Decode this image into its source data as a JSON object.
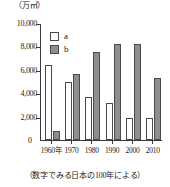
{
  "chart_data": {
    "type": "bar",
    "title": "",
    "subtitle": "",
    "unit_label": "（万㎡）",
    "xlabel": "",
    "ylabel": "",
    "categories": [
      "1960年",
      "1970",
      "1980",
      "1990",
      "2000",
      "2010"
    ],
    "series": [
      {
        "name": "a",
        "values": [
          6400,
          4950,
          3700,
          3150,
          1900,
          1900
        ],
        "color": "#ffffff"
      },
      {
        "name": "b",
        "values": [
          750,
          5600,
          7500,
          8200,
          8200,
          5300
        ],
        "color": "#8e8e8e"
      }
    ],
    "ylim": [
      0,
      10000
    ],
    "yticks": [
      0,
      2000,
      4000,
      6000,
      8000,
      10000
    ],
    "ytick_labels": [
      "0",
      "2,000",
      "4,000",
      "6,000",
      "8,000",
      "10,000"
    ],
    "grid": false,
    "legend_position": "top-left",
    "caption": "（数字でみる日本の100年による）"
  },
  "legend": {
    "items": [
      {
        "label": "a"
      },
      {
        "label": "b"
      }
    ]
  },
  "zero_label": "0"
}
